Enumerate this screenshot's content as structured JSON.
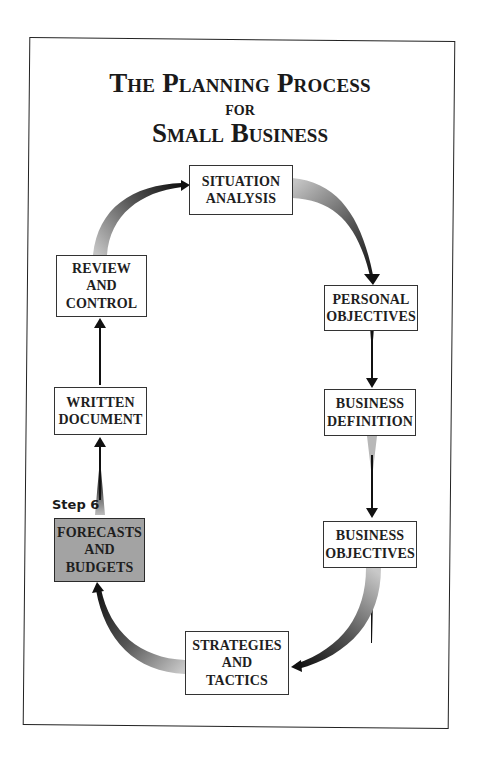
{
  "title": {
    "line1": "The Planning Process",
    "line2": "for",
    "line3": "Small Business"
  },
  "step_label": "Step 6",
  "nodes": [
    {
      "id": "situation-analysis",
      "label": "SITUATION\nANALYSIS",
      "highlighted": false
    },
    {
      "id": "personal-objectives",
      "label": "PERSONAL\nOBJECTIVES",
      "highlighted": false
    },
    {
      "id": "business-definition",
      "label": "BUSINESS\nDEFINITION",
      "highlighted": false
    },
    {
      "id": "business-objectives",
      "label": "BUSINESS\nOBJECTIVES",
      "highlighted": false
    },
    {
      "id": "strategies-and-tactics",
      "label": "STRATEGIES\nAND\nTACTICS",
      "highlighted": false
    },
    {
      "id": "forecasts-and-budgets",
      "label": "FORECASTS\nAND\nBUDGETS",
      "highlighted": true
    },
    {
      "id": "written-document",
      "label": "WRITTEN\nDOCUMENT",
      "highlighted": false
    },
    {
      "id": "review-and-control",
      "label": "REVIEW\nAND\nCONTROL",
      "highlighted": false
    }
  ],
  "edges": [
    {
      "from": "situation-analysis",
      "to": "personal-objectives"
    },
    {
      "from": "personal-objectives",
      "to": "business-definition"
    },
    {
      "from": "business-definition",
      "to": "business-objectives"
    },
    {
      "from": "business-objectives",
      "to": "strategies-and-tactics"
    },
    {
      "from": "strategies-and-tactics",
      "to": "forecasts-and-budgets"
    },
    {
      "from": "forecasts-and-budgets",
      "to": "written-document"
    },
    {
      "from": "written-document",
      "to": "review-and-control"
    },
    {
      "from": "review-and-control",
      "to": "situation-analysis"
    }
  ],
  "colors": {
    "highlight_fill": "#a3a3a3",
    "box_border": "#333333",
    "arrow_dark": "#111111",
    "arrow_light": "#c8c8c8"
  }
}
